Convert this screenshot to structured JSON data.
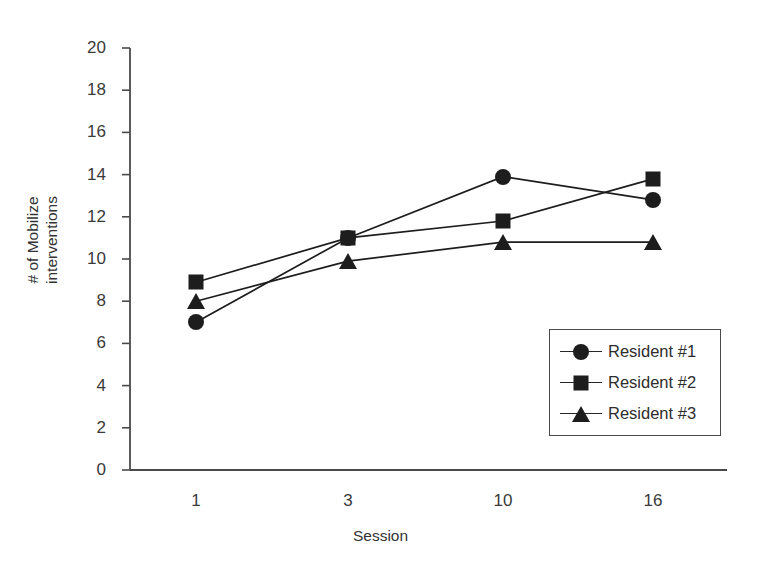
{
  "chart_data": {
    "type": "line",
    "title": "",
    "xlabel": "Session",
    "ylabel": "# of Mobilize interventions",
    "ylabel_line1": "# of Mobilize",
    "ylabel_line2": "interventions",
    "categories": [
      "1",
      "3",
      "10",
      "16"
    ],
    "x_tick_labels": [
      "1",
      "3",
      "10",
      "16"
    ],
    "y_tick_labels": [
      "0",
      "2",
      "4",
      "6",
      "8",
      "10",
      "12",
      "14",
      "16",
      "18",
      "20"
    ],
    "y_tick_values": [
      0,
      2,
      4,
      6,
      8,
      10,
      12,
      14,
      16,
      18,
      20
    ],
    "ylim": [
      0,
      20
    ],
    "grid": false,
    "legend_position": "lower-right-inside",
    "series": [
      {
        "name": "Resident #1",
        "marker": "circle",
        "color": "#1d1d1d",
        "values": [
          7.0,
          11.0,
          13.9,
          12.8
        ]
      },
      {
        "name": "Resident #2",
        "marker": "square",
        "color": "#1d1d1d",
        "values": [
          8.9,
          11.0,
          11.8,
          13.8
        ]
      },
      {
        "name": "Resident #3",
        "marker": "triangle",
        "color": "#1d1d1d",
        "values": [
          8.0,
          9.9,
          10.8,
          10.8
        ]
      }
    ]
  },
  "legend": {
    "entries": [
      {
        "label": "Resident #1",
        "marker": "circle"
      },
      {
        "label": "Resident #2",
        "marker": "square"
      },
      {
        "label": "Resident #3",
        "marker": "triangle"
      }
    ]
  },
  "colors": {
    "ink": "#1d1d1d",
    "axis": "#4a4a4a",
    "text": "#333333",
    "background": "#ffffff"
  }
}
